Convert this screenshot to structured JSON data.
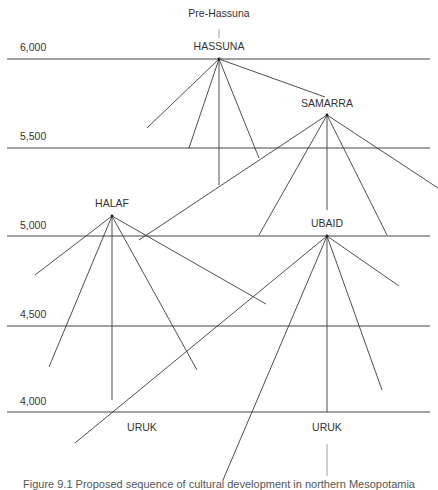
{
  "diagram": {
    "time_axis": [
      {
        "label": "6,000",
        "y": 59
      },
      {
        "label": "5,500",
        "y": 148
      },
      {
        "label": "5,000",
        "y": 236
      },
      {
        "label": "4,500",
        "y": 326
      },
      {
        "label": "4,000",
        "y": 412
      }
    ],
    "nodes": {
      "pre_hassuna": {
        "label": "Pre-Hassuna",
        "x": 219,
        "y": 12
      },
      "hassuna": {
        "label": "HASSUNA",
        "x": 219,
        "y": 59
      },
      "samarra": {
        "label": "SAMARRA",
        "x": 327,
        "y": 115
      },
      "halaf": {
        "label": "HALAF",
        "x": 112,
        "y": 216
      },
      "ubaid": {
        "label": "UBAID",
        "x": 327,
        "y": 236
      },
      "uruk_left": {
        "label": "URUK",
        "x": 142,
        "y": 426
      },
      "uruk_right": {
        "label": "URUK",
        "x": 327,
        "y": 426
      }
    },
    "caption": "Figure 9.1 Proposed sequence of cultural development in northern Mesopotamia"
  }
}
